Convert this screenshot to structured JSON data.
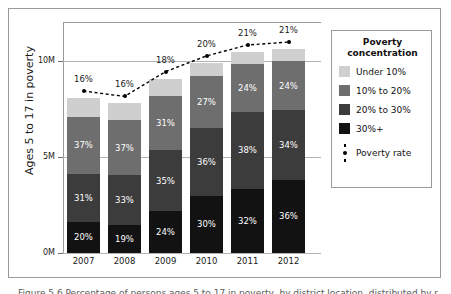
{
  "figure": {
    "caption": "Figure 5.6 Percentage of persons ages 5 to 17 in poverty, by district location, distributed by poverty concentration"
  },
  "chart_data": {
    "type": "bar",
    "stacked": true,
    "title": "",
    "xlabel": "",
    "ylabel": "Ages 5 to 17 in poverty",
    "categories": [
      "2007",
      "2008",
      "2009",
      "2010",
      "2011",
      "2012"
    ],
    "ytick_labels": [
      "0M",
      "5M",
      "10M"
    ],
    "ytick_values": [
      0,
      5000000,
      10000000
    ],
    "ylim": [
      0,
      12100000
    ],
    "grid": true,
    "legend_position": "right",
    "legend_title": "Poverty concentration",
    "series": [
      {
        "name": "Under 10%",
        "color": "#cfcfcf",
        "values": [
          12,
          11,
          10,
          7,
          6,
          6
        ]
      },
      {
        "name": "10% to 20%",
        "color": "#6e6e6e",
        "values": [
          37,
          37,
          31,
          27,
          24,
          24
        ]
      },
      {
        "name": "20% to 30%",
        "color": "#3c3c3c",
        "values": [
          31,
          33,
          35,
          36,
          38,
          34
        ]
      },
      {
        "name": "30%+",
        "color": "#121212",
        "values": [
          20,
          19,
          24,
          30,
          32,
          36
        ]
      }
    ],
    "segment_labels": {
      "Under 10%": [
        "",
        "",
        "",
        "",
        "",
        ""
      ],
      "10% to 20%": [
        "37%",
        "37%",
        "31%",
        "27%",
        "24%",
        "24%"
      ],
      "20% to 30%": [
        "31%",
        "33%",
        "35%",
        "36%",
        "38%",
        "34%"
      ],
      "30%+": [
        "20%",
        "19%",
        "24%",
        "30%",
        "32%",
        "36%"
      ]
    },
    "totals": [
      8070000,
      7790000,
      9080000,
      9900000,
      10470000,
      10620000
    ],
    "overlay": {
      "name": "Poverty rate",
      "type": "line",
      "style": "dashed",
      "marker": "circle",
      "color": "#000000",
      "labels": [
        "16%",
        "16%",
        "18%",
        "20%",
        "21%",
        "21%"
      ],
      "values": [
        16,
        16,
        18,
        20,
        21,
        21
      ]
    }
  },
  "legend": {
    "title_line1": "Poverty",
    "title_line2": "concentration",
    "items": [
      {
        "label": "Under 10%",
        "color": "#cfcfcf"
      },
      {
        "label": "10% to 20%",
        "color": "#6e6e6e"
      },
      {
        "label": "20% to 30%",
        "color": "#3c3c3c"
      },
      {
        "label": "30%+",
        "color": "#121212"
      }
    ],
    "rate_label": "Poverty rate"
  }
}
